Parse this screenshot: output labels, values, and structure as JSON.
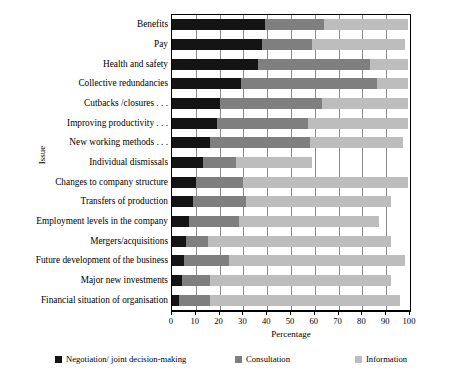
{
  "chart_data": {
    "type": "bar",
    "orientation": "horizontal",
    "stacked": true,
    "title": "",
    "xlabel": "Percentage",
    "ylabel": "Issue",
    "xlim": [
      0,
      100
    ],
    "xticks": [
      0,
      10,
      20,
      30,
      40,
      50,
      60,
      70,
      80,
      90,
      100
    ],
    "grid": true,
    "legend_position": "bottom",
    "colors": {
      "negotiation": "#141414",
      "consultation": "#7f7f7f",
      "information": "#bdbdbd"
    },
    "series": [
      {
        "name": "Negotiation/ joint decision-making",
        "key": "negotiation",
        "values": [
          39,
          38,
          36,
          29,
          20,
          19,
          16,
          13,
          10,
          9,
          7,
          6,
          5,
          4,
          3
        ]
      },
      {
        "name": "Consultation",
        "key": "consultation",
        "values": [
          25,
          21,
          47,
          57,
          43,
          38,
          42,
          14,
          20,
          22,
          21,
          9,
          19,
          12,
          13
        ]
      },
      {
        "name": "Information",
        "key": "information",
        "values": [
          35,
          39,
          16,
          13,
          36,
          42,
          39,
          32,
          69,
          61,
          59,
          77,
          74,
          76,
          80
        ]
      }
    ],
    "categories": [
      "Benefits",
      "Pay",
      "Health and safety",
      "Collective redundancies",
      "Cutbacks /closures . . .",
      "Improving productivity . . .",
      "New working methods . . .",
      "Individual dismissals",
      "Changes to company structure",
      "Transfers of production",
      "Employment levels in the company",
      "Mergers/acquisitions",
      "Future development of the business",
      "Major new investments",
      "Financial situation of organisation"
    ]
  },
  "legend": {
    "items": [
      {
        "label": "Negotiation/ joint decision-making",
        "key": "negotiation"
      },
      {
        "label": "Consultation",
        "key": "consultation"
      },
      {
        "label": "Information",
        "key": "information"
      }
    ]
  }
}
